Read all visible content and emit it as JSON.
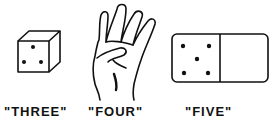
{
  "figures": [
    {
      "name": "die",
      "label": "\"THREE\"",
      "pips": 3
    },
    {
      "name": "hand",
      "label": "\"FOUR\"",
      "fingers": 4
    },
    {
      "name": "domino",
      "label": "\"FIVE\"",
      "pips": 5
    }
  ],
  "colors": {
    "ink": "#111111",
    "background": "#ffffff"
  }
}
